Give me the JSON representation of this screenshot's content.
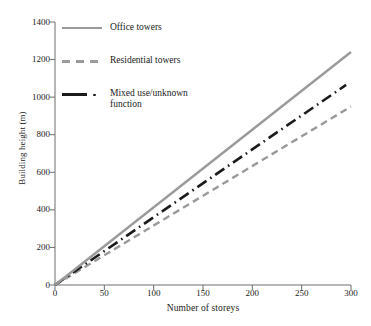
{
  "chart_data": {
    "type": "line",
    "title": "",
    "subtitle": "",
    "xlabel": "Number of storeys",
    "ylabel": "Building height (m)",
    "xlim": [
      0,
      300
    ],
    "ylim": [
      0,
      1400
    ],
    "xticks": [
      0,
      50,
      100,
      150,
      200,
      250,
      300
    ],
    "yticks": [
      0,
      200,
      400,
      600,
      800,
      1000,
      1200,
      1400
    ],
    "grid": false,
    "legend_position": "upper-left-inside",
    "x": [
      0,
      50,
      100,
      150,
      200,
      250,
      300
    ],
    "series": [
      {
        "name": "Office towers",
        "values": [
          0,
          207,
          413,
          620,
          827,
          1033,
          1240
        ],
        "color": "#9a9a9a",
        "style": "solid",
        "slope_m_per_storey": 4.13
      },
      {
        "name": "Residential towers",
        "values": [
          0,
          158,
          317,
          475,
          633,
          792,
          950
        ],
        "color": "#9a9a9a",
        "style": "dashed",
        "slope_m_per_storey": 3.17
      },
      {
        "name": "Mixed use/unknown function",
        "values": [
          0,
          180,
          361,
          541,
          722,
          902,
          1083
        ],
        "color": "#1b1b1b",
        "style": "dash-dot",
        "slope_m_per_storey": 3.61,
        "x_end": 295,
        "value_end": 1065
      }
    ]
  },
  "axes": {
    "ytick_labels": [
      "1400",
      "1200",
      "1000",
      "800",
      "600",
      "400",
      "200",
      "0"
    ],
    "xtick_labels": [
      "0",
      "50",
      "100",
      "150",
      "200",
      "250",
      "300"
    ],
    "ylabel": "Building height (m)",
    "xlabel": "Number of storeys"
  },
  "legend": {
    "items": [
      {
        "label": "Office towers",
        "icon": "solid-line-swatch"
      },
      {
        "label": "Residential towers",
        "icon": "dashed-line-swatch"
      },
      {
        "label": "Mixed use/unknown\nfunction",
        "icon": "dash-dot-line-swatch"
      }
    ]
  },
  "colors": {
    "gray_series": "#9a9a9a",
    "black_series": "#1b1b1b",
    "axis": "#6e6e6e",
    "text": "#1a1a1a",
    "background": "#ffffff"
  }
}
